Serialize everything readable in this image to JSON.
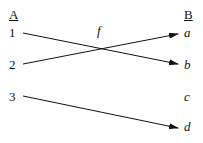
{
  "diagram": {
    "domain_set": {
      "label": "A",
      "elements": [
        "1",
        "2",
        "3"
      ]
    },
    "codomain_set": {
      "label": "B",
      "elements": [
        "a",
        "b",
        "c",
        "d"
      ]
    },
    "function_label": "f",
    "mappings": [
      {
        "from": "1",
        "to": "b"
      },
      {
        "from": "2",
        "to": "a"
      },
      {
        "from": "3",
        "to": "d"
      }
    ]
  }
}
